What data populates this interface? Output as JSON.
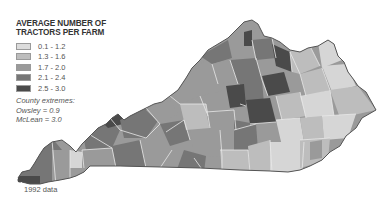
{
  "legend": {
    "title_line1": "AVERAGE NUMBER OF",
    "title_line2": "TRACTORS PER FARM",
    "items": [
      {
        "label": "0.1 - 1.2",
        "color": "#dcdcdc"
      },
      {
        "label": "1.3 - 1.6",
        "color": "#bdbdbd"
      },
      {
        "label": "1.7 - 2.0",
        "color": "#9a9a9a"
      },
      {
        "label": "2.1 - 2.4",
        "color": "#767676"
      },
      {
        "label": "2.5 - 3.0",
        "color": "#4a4a4a"
      }
    ]
  },
  "extremes": {
    "heading": "County extremes:",
    "min": "Owsley = 0.9",
    "max": "McLean = 3.0"
  },
  "footnote": "1992 data",
  "map": {
    "region": "Kentucky",
    "unit": "county",
    "border_color": "#555555",
    "county_line_color": "#e6e6e6"
  }
}
